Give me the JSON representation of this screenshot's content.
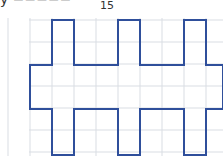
{
  "caption": {
    "text": "y  −−−−−",
    "subscript": "15"
  },
  "grid": {
    "x0": 30,
    "y0": 20,
    "cell": 22,
    "cols": 9,
    "rows": 7,
    "line_color": "#d9dde3"
  },
  "shape": {
    "stroke": "#2f4f9b",
    "points": "52,20 74,20 74,65 118,65 118,20 140,20 140,65 184,65 184,20 206,20 206,65 223,65 223,109 206,109 206,155 184,155 184,109 140,109 140,155 118,155 118,109 74,109 74,155 52,155 52,109 30,109 30,65 52,65"
  }
}
